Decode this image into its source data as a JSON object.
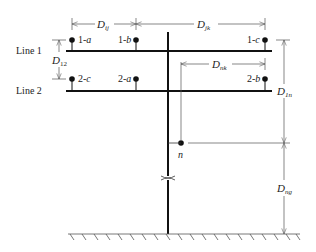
{
  "diagram": {
    "lines": [
      {
        "label": "Line 1",
        "y": 51
      },
      {
        "label": "Line 2",
        "y": 91
      }
    ],
    "conductors": [
      {
        "id": "1-a",
        "prefix": "1-",
        "phase": "a",
        "x": 72,
        "y": 40,
        "label_side": "right"
      },
      {
        "id": "1-b",
        "prefix": "1-",
        "phase": "b",
        "x": 136,
        "y": 40,
        "label_side": "left"
      },
      {
        "id": "1-c",
        "prefix": "1-",
        "phase": "c",
        "x": 265,
        "y": 40,
        "label_side": "left"
      },
      {
        "id": "2-c",
        "prefix": "2-",
        "phase": "c",
        "x": 72,
        "y": 79,
        "label_side": "right"
      },
      {
        "id": "2-a",
        "prefix": "2-",
        "phase": "a",
        "x": 136,
        "y": 79,
        "label_side": "left"
      },
      {
        "id": "2-b",
        "prefix": "2-",
        "phase": "b",
        "x": 265,
        "y": 79,
        "label_side": "left"
      }
    ],
    "neutral": {
      "label": "n",
      "x": 181,
      "y": 143
    },
    "dimensions": {
      "D_ij": {
        "main": "D",
        "sub": "ij"
      },
      "D_jk": {
        "main": "D",
        "sub": "jk"
      },
      "D_12": {
        "main": "D",
        "sub": "12"
      },
      "D_nk": {
        "main": "D",
        "sub": "nk"
      },
      "D_1n": {
        "main": "D",
        "sub": "1n"
      },
      "D_ng": {
        "main": "D",
        "sub": "ng"
      }
    },
    "colors": {
      "ink": "#111111",
      "dim_line": "#555555"
    }
  }
}
